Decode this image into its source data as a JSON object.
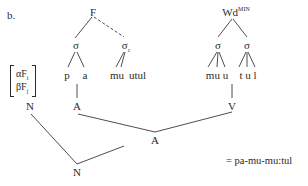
{
  "diagram": {
    "label": "b.",
    "left_tree": {
      "root": "F",
      "syllables": [
        {
          "label": "σ",
          "sub": "",
          "segments": [
            "p",
            "a"
          ]
        },
        {
          "label": "σ",
          "sub": "c",
          "segments": [
            "mu",
            "utul"
          ],
          "link": "dashed"
        }
      ]
    },
    "right_tree": {
      "root": "Wd",
      "root_sup": "MIN",
      "syllables": [
        {
          "label": "σ",
          "segments_text": "mu u"
        },
        {
          "label": "σ",
          "segments_text": "t u l"
        }
      ]
    },
    "feature_matrix": {
      "rows": [
        {
          "alpha": "α",
          "feat": "F",
          "sub": "i"
        },
        {
          "alpha": "β",
          "feat": "F",
          "sub": "j"
        }
      ]
    },
    "nodes": {
      "n_left": "N",
      "a_left": "A",
      "v_right": "V",
      "a_center": "A",
      "n_bottom": "N"
    },
    "result": "= pa-mu-mu:tul"
  },
  "colors": {
    "line": "#3a3a3a",
    "text": "#2a2a2a",
    "background": "#ffffff"
  }
}
